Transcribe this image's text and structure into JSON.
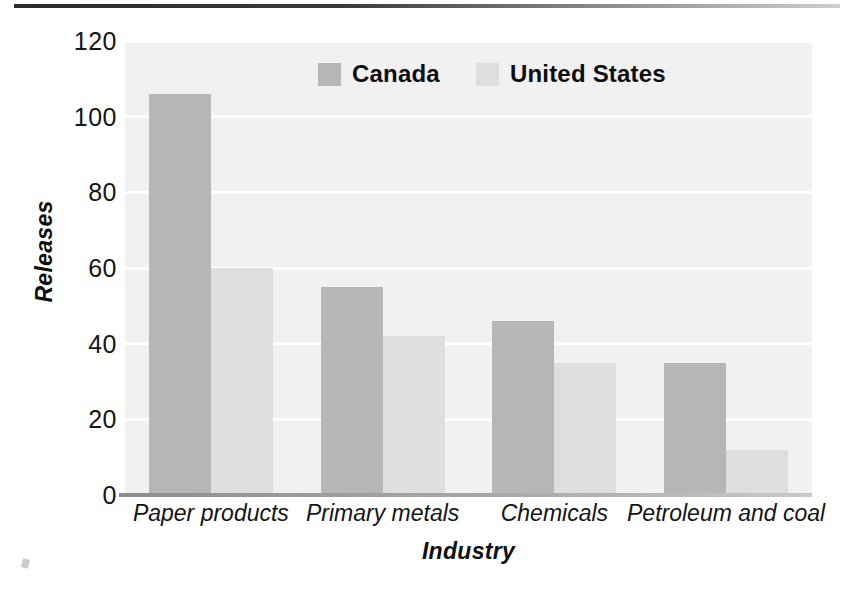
{
  "chart_data": {
    "type": "bar",
    "title": "",
    "xlabel": "Industry",
    "ylabel": "Releases",
    "categories": [
      "Paper products",
      "Primary metals",
      "Chemicals",
      "Petroleum and coal"
    ],
    "series": [
      {
        "name": "Canada",
        "color": "#b6b6b6",
        "values": [
          106,
          55,
          46,
          35
        ]
      },
      {
        "name": "United States",
        "color": "#dedede",
        "values": [
          60,
          42,
          35,
          12
        ]
      }
    ],
    "ylim": [
      0,
      120
    ],
    "yticks": [
      0,
      20,
      40,
      60,
      80,
      100,
      120
    ],
    "ytick_labels": [
      "0",
      "20",
      "40",
      "60",
      "80",
      "100",
      "120"
    ],
    "grid": "horizontal-white-gridlines",
    "legend_position": "top-center",
    "plot_background": "#f1f1f1"
  },
  "legend": {
    "items": [
      {
        "label": "Canada"
      },
      {
        "label": "United States"
      }
    ]
  }
}
